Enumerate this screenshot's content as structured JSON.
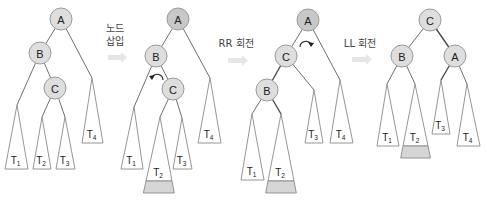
{
  "colors": {
    "node_fill": "#dedede",
    "node_fill_highlight": "#c8c8c8",
    "shade": "#d6d6d6",
    "edge": "#6e6e6e",
    "step_arrow": "#e6e6e6"
  },
  "steps": [
    {
      "id": "insert",
      "lines": [
        "노드",
        "삽입"
      ],
      "label_x": 115,
      "label_y": [
        32,
        45
      ],
      "arrow": {
        "x": 108,
        "y": 53,
        "w": 19,
        "h": 9
      }
    },
    {
      "id": "rr",
      "lines": [
        "RR 회전"
      ],
      "label_x": 236,
      "label_y": [
        47
      ],
      "arrow": {
        "x": 228,
        "y": 56,
        "w": 20,
        "h": 9
      }
    },
    {
      "id": "ll",
      "lines": [
        "LL 회전"
      ],
      "label_x": 360,
      "label_y": [
        47
      ],
      "arrow": {
        "x": 352,
        "y": 55,
        "w": 20,
        "h": 9
      }
    }
  ],
  "trees": [
    {
      "id": "tree-1-initial",
      "nodes": [
        {
          "label": "A",
          "x": 61,
          "y": 19,
          "highlight": false
        },
        {
          "label": "B",
          "x": 40,
          "y": 53,
          "highlight": false
        },
        {
          "label": "C",
          "x": 55,
          "y": 88,
          "highlight": false
        }
      ],
      "edges": [
        {
          "from": [
            61,
            19
          ],
          "to": [
            40,
            53
          ],
          "dark": false
        },
        {
          "from": [
            61,
            19
          ],
          "to": [
            92,
            78
          ],
          "dark": false
        },
        {
          "from": [
            40,
            53
          ],
          "to": [
            55,
            88
          ],
          "dark": false
        },
        {
          "from": [
            40,
            53
          ],
          "to": [
            17,
            105
          ],
          "dark": false
        },
        {
          "from": [
            55,
            88
          ],
          "to": [
            42,
            117
          ],
          "dark": false
        },
        {
          "from": [
            55,
            88
          ],
          "to": [
            65,
            117
          ],
          "dark": false
        }
      ],
      "subtrees": [
        {
          "name": "T",
          "index": "1",
          "apex": [
            17,
            105
          ],
          "base": [
            5,
            28,
            169
          ],
          "shade": null
        },
        {
          "name": "T",
          "index": "2",
          "apex": [
            42,
            117
          ],
          "base": [
            33,
            51,
            169
          ],
          "shade": null
        },
        {
          "name": "T",
          "index": "3",
          "apex": [
            65,
            117
          ],
          "base": [
            56,
            75,
            169
          ],
          "shade": null
        },
        {
          "name": "T",
          "index": "4",
          "apex": [
            92,
            78
          ],
          "base": [
            82,
            103,
            143
          ],
          "shade": null
        }
      ],
      "rotation_arrow": null
    },
    {
      "id": "tree-2-after-insert",
      "nodes": [
        {
          "label": "A",
          "x": 178,
          "y": 19,
          "highlight": true
        },
        {
          "label": "B",
          "x": 156,
          "y": 56,
          "highlight": false
        },
        {
          "label": "C",
          "x": 173,
          "y": 89,
          "highlight": false
        }
      ],
      "edges": [
        {
          "from": [
            178,
            19
          ],
          "to": [
            156,
            56
          ],
          "dark": false
        },
        {
          "from": [
            178,
            19
          ],
          "to": [
            210,
            78
          ],
          "dark": false
        },
        {
          "from": [
            156,
            56
          ],
          "to": [
            173,
            89
          ],
          "dark": false
        },
        {
          "from": [
            156,
            56
          ],
          "to": [
            134,
            107
          ],
          "dark": false
        },
        {
          "from": [
            173,
            89
          ],
          "to": [
            160,
            117
          ],
          "dark": false
        },
        {
          "from": [
            173,
            89
          ],
          "to": [
            182,
            118
          ],
          "dark": false
        }
      ],
      "subtrees": [
        {
          "name": "T",
          "index": "1",
          "apex": [
            134,
            107
          ],
          "base": [
            121,
            143,
            169
          ],
          "shade": null
        },
        {
          "name": "T",
          "index": "2",
          "apex": [
            160,
            117
          ],
          "base": [
            146,
            172,
            181
          ],
          "shade": [
            193
          ]
        },
        {
          "name": "T",
          "index": "3",
          "apex": [
            182,
            118
          ],
          "base": [
            173,
            192,
            169
          ],
          "shade": null
        },
        {
          "name": "T",
          "index": "4",
          "apex": [
            210,
            78
          ],
          "base": [
            198,
            221,
            143
          ],
          "shade": null
        }
      ],
      "rotation_arrow": {
        "cx": 157,
        "cy": 78,
        "dir": "ccw"
      }
    },
    {
      "id": "tree-3-after-rr",
      "nodes": [
        {
          "label": "A",
          "x": 308,
          "y": 20,
          "highlight": true
        },
        {
          "label": "C",
          "x": 286,
          "y": 56,
          "highlight": false
        },
        {
          "label": "B",
          "x": 267,
          "y": 90,
          "highlight": false
        }
      ],
      "edges": [
        {
          "from": [
            308,
            20
          ],
          "to": [
            286,
            56
          ],
          "dark": false
        },
        {
          "from": [
            308,
            20
          ],
          "to": [
            340,
            80
          ],
          "dark": false
        },
        {
          "from": [
            286,
            56
          ],
          "to": [
            267,
            90
          ],
          "dark": true
        },
        {
          "from": [
            286,
            56
          ],
          "to": [
            314,
            90
          ],
          "dark": false
        },
        {
          "from": [
            267,
            90
          ],
          "to": [
            252,
            114
          ],
          "dark": false
        },
        {
          "from": [
            267,
            90
          ],
          "to": [
            281,
            114
          ],
          "dark": true
        }
      ],
      "subtrees": [
        {
          "name": "T",
          "index": "1",
          "apex": [
            252,
            114
          ],
          "base": [
            241,
            264,
            180
          ],
          "shade": null
        },
        {
          "name": "T",
          "index": "2",
          "apex": [
            281,
            114
          ],
          "base": [
            268,
            294,
            181
          ],
          "shade": [
            193
          ]
        },
        {
          "name": "T",
          "index": "3",
          "apex": [
            314,
            90
          ],
          "base": [
            305,
            323,
            143
          ],
          "shade": null
        },
        {
          "name": "T",
          "index": "4",
          "apex": [
            340,
            80
          ],
          "base": [
            330,
            353,
            143
          ],
          "shade": null
        }
      ],
      "rotation_arrow": {
        "cx": 306,
        "cy": 45,
        "dir": "cw"
      }
    },
    {
      "id": "tree-4-after-ll",
      "nodes": [
        {
          "label": "C",
          "x": 430,
          "y": 20,
          "highlight": false
        },
        {
          "label": "B",
          "x": 402,
          "y": 56,
          "highlight": false
        },
        {
          "label": "A",
          "x": 455,
          "y": 56,
          "highlight": false
        }
      ],
      "edges": [
        {
          "from": [
            430,
            20
          ],
          "to": [
            402,
            56
          ],
          "dark": false
        },
        {
          "from": [
            430,
            20
          ],
          "to": [
            455,
            56
          ],
          "dark": true
        },
        {
          "from": [
            402,
            56
          ],
          "to": [
            387,
            84
          ],
          "dark": false
        },
        {
          "from": [
            402,
            56
          ],
          "to": [
            415,
            84
          ],
          "dark": false
        },
        {
          "from": [
            455,
            56
          ],
          "to": [
            441,
            80
          ],
          "dark": true
        },
        {
          "from": [
            455,
            56
          ],
          "to": [
            467,
            84
          ],
          "dark": false
        }
      ],
      "subtrees": [
        {
          "name": "T",
          "index": "1",
          "apex": [
            387,
            84
          ],
          "base": [
            377,
            399,
            146
          ],
          "shade": null
        },
        {
          "name": "T",
          "index": "2",
          "apex": [
            415,
            84
          ],
          "base": [
            403,
            428,
            146
          ],
          "shade": [
            158
          ]
        },
        {
          "name": "T",
          "index": "3",
          "apex": [
            441,
            80
          ],
          "base": [
            432,
            450,
            134
          ],
          "shade": null
        },
        {
          "name": "T",
          "index": "4",
          "apex": [
            467,
            84
          ],
          "base": [
            457,
            480,
            146
          ],
          "shade": null
        }
      ],
      "rotation_arrow": null
    }
  ]
}
